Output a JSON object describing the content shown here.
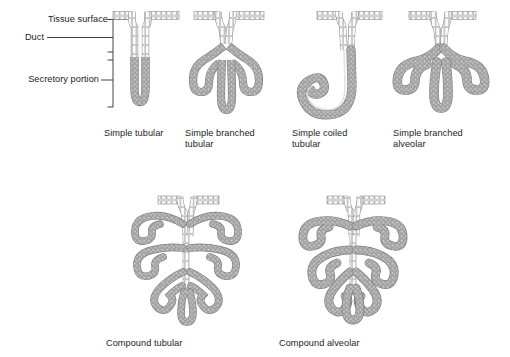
{
  "figure": {
    "title_visible": false,
    "background_color": "#ffffff",
    "annotations": {
      "tissue_surface": "Tissue surface",
      "duct": "Duct",
      "secretory_portion": "Secretory portion"
    },
    "colors": {
      "outline": "#6e6e6e",
      "duct_fill": "#f2f2f2",
      "secretory_fill": "#9a9a9a",
      "secretory_fill_light": "#b0b0b0",
      "epithelium_fill": "#ededed",
      "leader_line": "#333333",
      "text": "#1c1c1c"
    },
    "row1": [
      {
        "id": "simple-tubular",
        "caption": "Simple tubular",
        "caption_lines": [
          "Simple tubular"
        ],
        "caption_x": 104,
        "caption_y": 128
      },
      {
        "id": "simple-branched-tubular",
        "caption": "Simple branched tubular",
        "caption_lines": [
          "Simple branched",
          "tubular"
        ],
        "caption_x": 185,
        "caption_y": 128
      },
      {
        "id": "simple-coiled-tubular",
        "caption": "Simple coiled tubular",
        "caption_lines": [
          "Simple coiled",
          "tubular"
        ],
        "caption_x": 292,
        "caption_y": 128
      },
      {
        "id": "simple-branched-alveolar",
        "caption": "Simple branched alveolar",
        "caption_lines": [
          "Simple branched",
          "alveolar"
        ],
        "caption_x": 393,
        "caption_y": 128
      }
    ],
    "row2": [
      {
        "id": "compound-tubular",
        "caption": "Compound tubular",
        "caption_lines": [
          "Compound tubular"
        ],
        "caption_x": 106,
        "caption_y": 338
      },
      {
        "id": "compound-alveolar",
        "caption": "Compound alveolar",
        "caption_lines": [
          "Compound alveolar"
        ],
        "caption_x": 279,
        "caption_y": 338
      }
    ]
  }
}
